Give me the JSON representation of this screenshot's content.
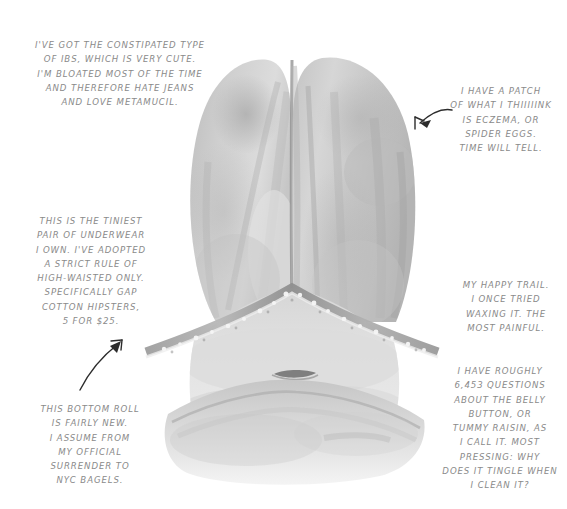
{
  "page": {
    "background_color": "#ffffff",
    "text_color": "#8a8a8a",
    "arrow_color": "#2c2c2c"
  },
  "illustration": {
    "name": "watercolor-belly-torso-illustration",
    "description": "Grayscale watercolor and pencil illustration of a human torso / belly seen from above, with a lace-trimmed underwear waistband, a navel, and a lower belly roll",
    "palette": {
      "light": "#e9e9e9",
      "mid": "#c9c9c9",
      "shadow": "#a8a8a8",
      "dark": "#8e8e8e",
      "line": "#7a7a7a"
    }
  },
  "annotations": [
    {
      "id": "note-ibs",
      "name": "annotation-ibs",
      "align": "center",
      "has_arrow": false,
      "text": "I'VE GOT THE CONSTIPATED TYPE\nOF IBS, WHICH IS VERY CUTE.\nI'M BLOATED MOST OF THE TIME\nAND THEREFORE HATE JEANS\nAND LOVE METAMUCIL."
    },
    {
      "id": "note-eczema",
      "name": "annotation-eczema",
      "align": "center",
      "has_arrow": true,
      "arrow_name": "arrow-pointing-to-skin-patch",
      "text": "I HAVE A PATCH\nOF WHAT I THIIIIINK\nIS ECZEMA, OR\nSPIDER EGGS.\nTIME WILL TELL."
    },
    {
      "id": "note-underwear",
      "name": "annotation-underwear",
      "align": "center",
      "has_arrow": true,
      "arrow_name": "arrow-pointing-to-waistband",
      "text": "THIS IS THE TINIEST\nPAIR OF UNDERWEAR\nI OWN. I'VE ADOPTED\nA STRICT RULE OF\nHIGH-WAISTED ONLY.\nSPECIFICALLY GAP\nCOTTON HIPSTERS,\n5 FOR $25."
    },
    {
      "id": "note-trail",
      "name": "annotation-happy-trail",
      "align": "center",
      "has_arrow": false,
      "text": "MY HAPPY TRAIL.\nI ONCE TRIED\nWAXING IT. THE\nMOST PAINFUL."
    },
    {
      "id": "note-bottomroll",
      "name": "annotation-bottom-roll",
      "align": "center",
      "has_arrow": false,
      "text": "THIS BOTTOM ROLL\nIS FAIRLY NEW.\nI ASSUME FROM\nMY OFFICIAL\nSURRENDER TO\nNYC BAGELS."
    },
    {
      "id": "note-bellybutton",
      "name": "annotation-belly-button",
      "align": "center",
      "has_arrow": false,
      "text": "I HAVE ROUGHLY\n6,453 QUESTIONS\nABOUT THE BELLY\nBUTTON, OR\nTUMMY RAISIN, AS\nI CALL IT. MOST\nPRESSING: WHY\nDOES IT TINGLE WHEN\nI CLEAN IT?"
    }
  ]
}
